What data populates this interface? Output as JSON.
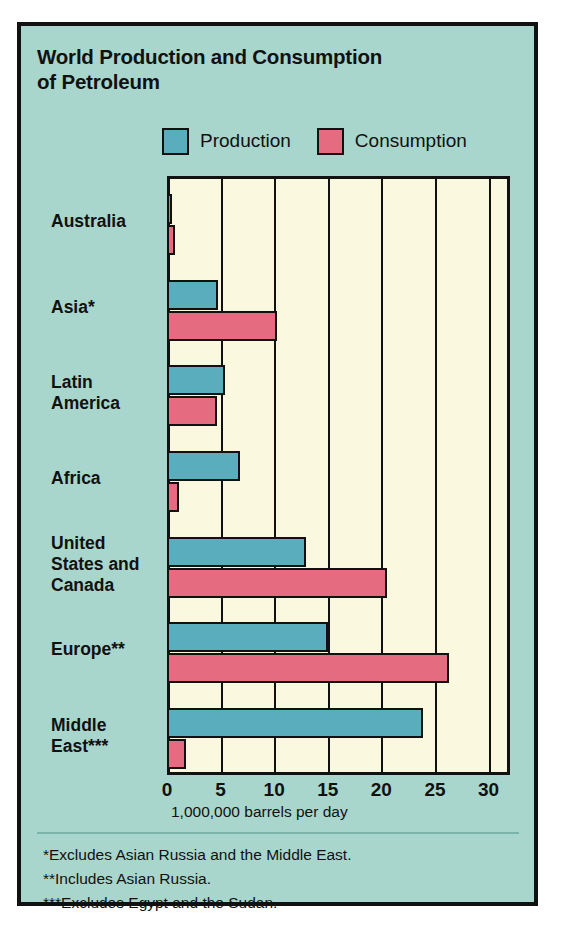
{
  "figure": {
    "title": "World Production and Consumption of Petroleum",
    "title_lines": [
      "World Production and Consumption",
      "of Petroleum"
    ],
    "background_color": "#a9d6cc",
    "plot_background_color": "#faf9e0",
    "frame_color": "#111111"
  },
  "legend": {
    "position": "top",
    "items": [
      {
        "label": "Production",
        "color": "#5aadbd",
        "swatch_name": "production-swatch"
      },
      {
        "label": "Consumption",
        "color": "#e46b80",
        "swatch_name": "consumption-swatch"
      }
    ]
  },
  "axis": {
    "title": "1,000,000 barrels per day",
    "ticks": [
      "0",
      "5",
      "10",
      "15",
      "20",
      "25",
      "30"
    ],
    "tick_values": [
      0,
      5,
      10,
      15,
      20,
      25,
      30
    ],
    "min": 0,
    "max": 32
  },
  "footnotes": [
    "*Excludes Asian Russia and the Middle East.",
    "**Includes Asian Russia.",
    "***Excludes Egypt and the Sudan."
  ],
  "chart_data": {
    "type": "bar",
    "orientation": "horizontal",
    "title": "World Production and Consumption of Petroleum",
    "xlabel": "1,000,000 barrels per day",
    "ylabel": "",
    "xlim": [
      0,
      32
    ],
    "xticks": [
      0,
      5,
      10,
      15,
      20,
      25,
      30
    ],
    "grid": true,
    "legend_position": "top",
    "units": "million barrels per day",
    "categories": [
      "Australia",
      "Asia*",
      "Latin America",
      "Africa",
      "United States and Canada",
      "Europe**",
      "Middle East***"
    ],
    "category_lines": [
      [
        "Australia"
      ],
      [
        "Asia*"
      ],
      [
        "Latin",
        "America"
      ],
      [
        "Africa"
      ],
      [
        "United",
        "States and",
        "Canada"
      ],
      [
        "Europe**"
      ],
      [
        "Middle",
        "East***"
      ]
    ],
    "series": [
      {
        "name": "Production",
        "color": "#5aadbd",
        "values": [
          0.5,
          4.8,
          5.4,
          6.8,
          13.0,
          15.0,
          23.9
        ]
      },
      {
        "name": "Consumption",
        "color": "#e46b80",
        "values": [
          0.7,
          10.3,
          4.7,
          1.1,
          20.5,
          26.3,
          1.8
        ]
      }
    ]
  }
}
